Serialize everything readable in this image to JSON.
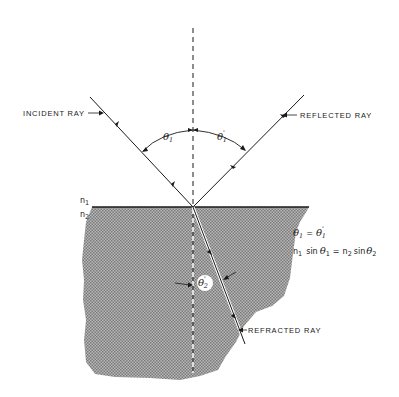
{
  "diagram": {
    "labels": {
      "incident_ray": "INCIDENT RAY",
      "reflected_ray": "REFLECTED RAY",
      "refracted_ray": "REFRACTED RAY",
      "n1": "n",
      "n1_sub": "1",
      "n2": "n",
      "n2_sub": "2",
      "theta1": "θ",
      "theta1_sub": "1",
      "theta1_prime": "θ",
      "theta1_prime_sub": "1",
      "theta1_prime_mark": "'",
      "theta2": "θ",
      "theta2_sub": "2",
      "theta2_mark": "'"
    },
    "equations": {
      "eq1_left": "θ",
      "eq1_left_sub": "1",
      "eq1_op": "=",
      "eq1_right": "θ",
      "eq1_right_sub": "1",
      "eq1_right_mark": "'",
      "eq2_n1": "n",
      "eq2_n1_sub": "1",
      "eq2_sin1": "sin",
      "eq2_theta1": "θ",
      "eq2_theta1_sub": "1",
      "eq2_op": "=",
      "eq2_n2": "n",
      "eq2_n2_sub": "2",
      "eq2_sin2": "sin",
      "eq2_theta2": "θ",
      "eq2_theta2_sub": "2"
    },
    "colors": {
      "ink": "#1a1a1a",
      "medium_fill": "#9a9a9a",
      "background": "#ffffff"
    }
  }
}
